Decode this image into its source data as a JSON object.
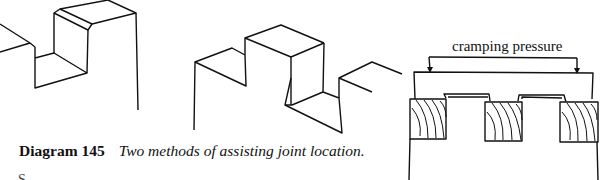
{
  "caption": {
    "number": "Diagram 145",
    "description": "Two methods of assisting joint location."
  },
  "figure_right": {
    "label": "cramping pressure"
  },
  "next_line_fragment": "S"
}
